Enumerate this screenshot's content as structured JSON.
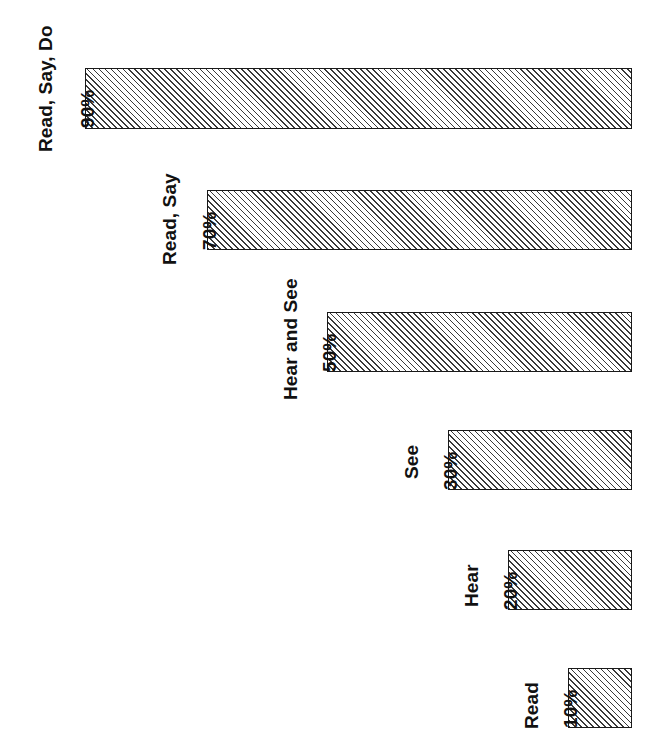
{
  "chart_data": {
    "type": "bar",
    "title": "",
    "subtitle": "",
    "xlabel": "",
    "ylabel": "",
    "orientation": "horizontal-right-aligned",
    "grid": false,
    "legend": false,
    "legend_position": "none",
    "xlim": [
      0,
      100
    ],
    "categories": [
      "Read, Say, Do",
      "Read, Say",
      "Hear and See",
      "See",
      "Hear",
      "Read"
    ],
    "values": [
      90,
      70,
      50,
      30,
      20,
      10
    ],
    "value_labels": [
      "90%",
      "70%",
      "50%",
      "30%",
      "20%",
      "10%"
    ],
    "bar_fill": "diagonal-hatch",
    "bar_border_color": "#1a1a1a",
    "bar_hatch_color": "#3a3a3a",
    "background_color": "#ffffff",
    "text_color": "#111111"
  },
  "bars": [
    {
      "category": "Read, Say, Do",
      "value": 90,
      "value_label": "90%",
      "left": 85,
      "top": 68,
      "width": 547,
      "height": 61,
      "cat_label_x": 36,
      "cat_label_y": 152,
      "val_label_x": 78,
      "val_label_y": 128
    },
    {
      "category": "Read, Say",
      "value": 70,
      "value_label": "70%",
      "left": 207,
      "top": 190,
      "width": 425,
      "height": 60,
      "cat_label_x": 160,
      "cat_label_y": 265,
      "val_label_x": 200,
      "val_label_y": 250
    },
    {
      "category": "Hear and See",
      "value": 50,
      "value_label": "50%",
      "left": 327,
      "top": 312,
      "width": 305,
      "height": 60,
      "cat_label_x": 281,
      "cat_label_y": 400,
      "val_label_x": 320,
      "val_label_y": 372
    },
    {
      "category": "See",
      "value": 30,
      "value_label": "30%",
      "left": 448,
      "top": 430,
      "width": 184,
      "height": 60,
      "cat_label_x": 402,
      "cat_label_y": 479,
      "val_label_x": 441,
      "val_label_y": 490
    },
    {
      "category": "Hear",
      "value": 20,
      "value_label": "20%",
      "left": 508,
      "top": 550,
      "width": 124,
      "height": 60,
      "cat_label_x": 462,
      "cat_label_y": 607,
      "val_label_x": 501,
      "val_label_y": 610
    },
    {
      "category": "Read",
      "value": 10,
      "value_label": "10%",
      "left": 568,
      "top": 668,
      "width": 64,
      "height": 60,
      "cat_label_x": 522,
      "cat_label_y": 729,
      "val_label_x": 561,
      "val_label_y": 728
    }
  ]
}
